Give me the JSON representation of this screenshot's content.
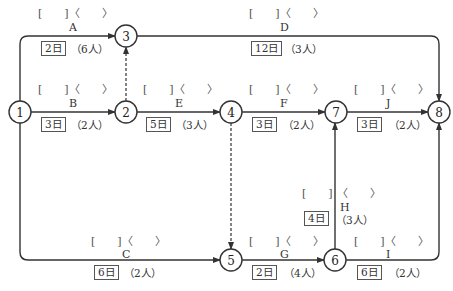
{
  "diagram": {
    "type": "arrow-network",
    "colors": {
      "line": "#333333",
      "text": "#333333",
      "background": "#ffffff"
    },
    "nodes": [
      {
        "id": "1",
        "label": "1"
      },
      {
        "id": "2",
        "label": "2"
      },
      {
        "id": "3",
        "label": "3"
      },
      {
        "id": "4",
        "label": "4"
      },
      {
        "id": "5",
        "label": "5"
      },
      {
        "id": "6",
        "label": "6"
      },
      {
        "id": "7",
        "label": "7"
      },
      {
        "id": "8",
        "label": "8"
      }
    ],
    "activities": {
      "A": {
        "name": "A",
        "from": "1",
        "to": "3",
        "bracket": "[　　]〈　　〉",
        "duration": "2日",
        "workers": "（6人）"
      },
      "B": {
        "name": "B",
        "from": "1",
        "to": "2",
        "bracket": "[　　]〈　　〉",
        "duration": "3日",
        "workers": "（2人）"
      },
      "C": {
        "name": "C",
        "from": "1",
        "to": "5",
        "bracket": "[　　]〈　　〉",
        "duration": "6日",
        "workers": "（2人）"
      },
      "D": {
        "name": "D",
        "from": "3",
        "to": "8",
        "bracket": "[　　]〈　　〉",
        "duration": "12日",
        "workers": "（3人）"
      },
      "E": {
        "name": "E",
        "from": "2",
        "to": "4",
        "bracket": "[　　]〈　　〉",
        "duration": "5日",
        "workers": "（3人）"
      },
      "F": {
        "name": "F",
        "from": "4",
        "to": "7",
        "bracket": "[　　]〈　　〉",
        "duration": "3日",
        "workers": "（2人）"
      },
      "G": {
        "name": "G",
        "from": "5",
        "to": "6",
        "bracket": "[　　]〈　　〉",
        "duration": "2日",
        "workers": "（4人）"
      },
      "H": {
        "name": "H",
        "from": "6",
        "to": "7",
        "bracket_left": "[　　]",
        "bracket_right": "〈　　〉",
        "duration": "4日",
        "workers": "（3人）"
      },
      "I": {
        "name": "I",
        "from": "6",
        "to": "8",
        "bracket": "[　　]〈　　〉",
        "duration": "6日",
        "workers": "（2人）"
      },
      "J": {
        "name": "J",
        "from": "7",
        "to": "8",
        "bracket": "[　　]〈　　〉",
        "duration": "3日",
        "workers": "（2人）"
      }
    },
    "dummies": [
      {
        "from": "2",
        "to": "3"
      },
      {
        "from": "4",
        "to": "5"
      }
    ]
  }
}
